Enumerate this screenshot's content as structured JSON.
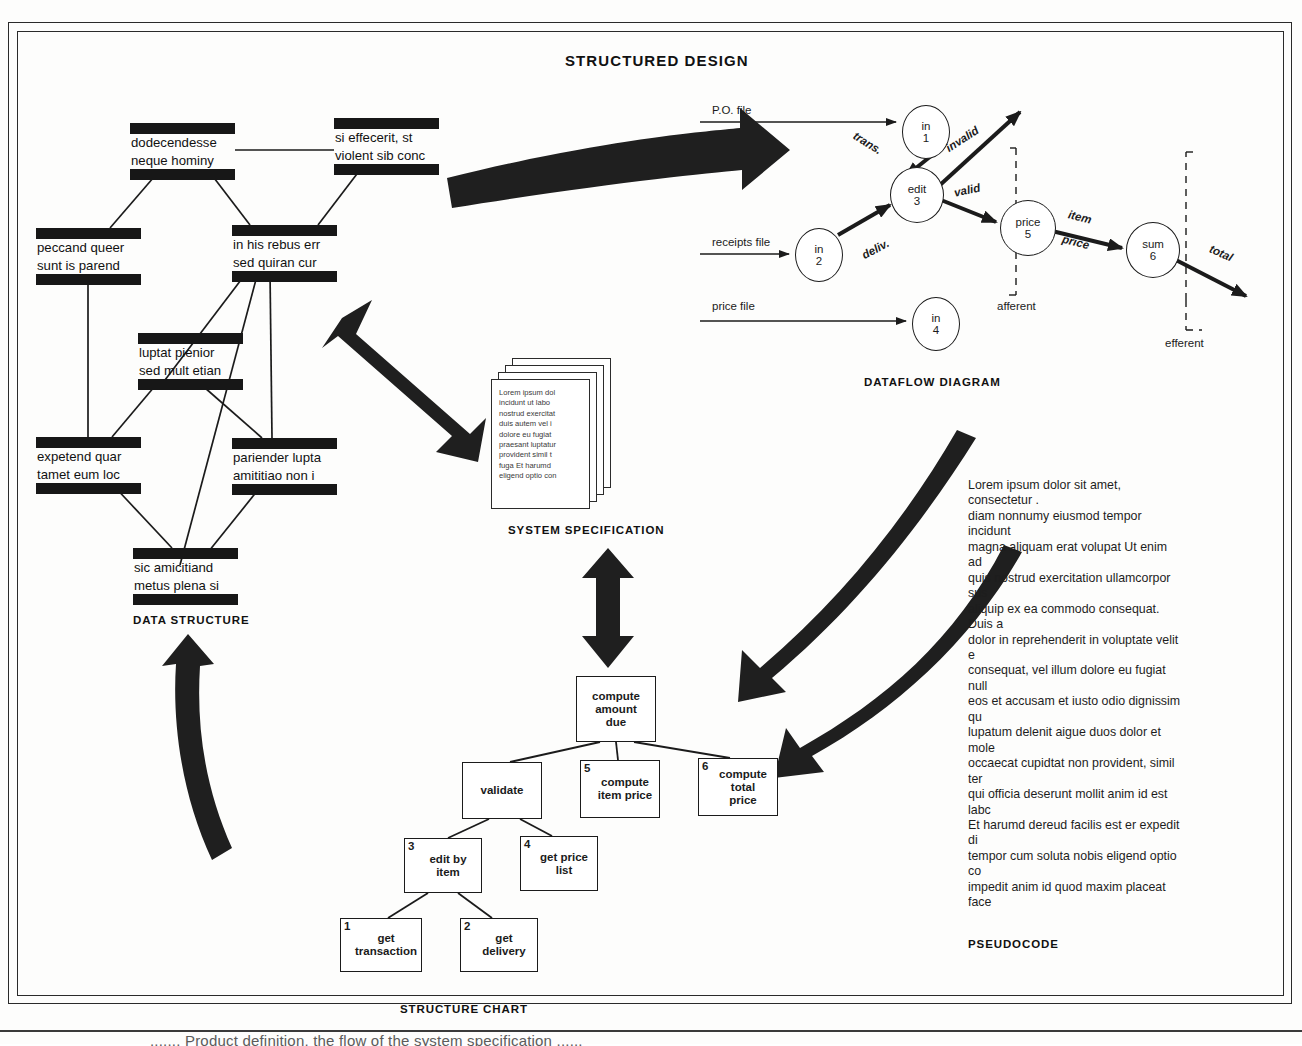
{
  "figure": {
    "title": "STRUCTURED DESIGN",
    "bottom_caption": "....... Product definition, the flow of the system specification ......"
  },
  "section_labels": {
    "data_structure": "DATA STRUCTURE",
    "dataflow_diagram": "DATAFLOW DIAGRAM",
    "system_specification": "SYSTEM SPECIFICATION",
    "structure_chart": "STRUCTURE CHART",
    "pseudocode": "PSEUDOCODE"
  },
  "data_structure": {
    "boxes": [
      {
        "id": "ds-dodecendesse",
        "line1": "dodecendesse",
        "line2": "neque hominy",
        "x": 130,
        "y": 123
      },
      {
        "id": "ds-si-effecerit",
        "line1": "si effecerit, st",
        "line2": "violent sib conc",
        "x": 334,
        "y": 118
      },
      {
        "id": "ds-peccand",
        "line1": "peccand queer",
        "line2": "sunt is parend",
        "x": 36,
        "y": 228
      },
      {
        "id": "ds-in-his-rebus",
        "line1": "in his rebus err",
        "line2": "sed quiran cur",
        "x": 232,
        "y": 225
      },
      {
        "id": "ds-luptat",
        "line1": "luptat pienior",
        "line2": "sed mult etian",
        "x": 138,
        "y": 333
      },
      {
        "id": "ds-expetend",
        "line1": "expetend quar",
        "line2": "tamet eum loc",
        "x": 36,
        "y": 437
      },
      {
        "id": "ds-pariender",
        "line1": "pariender lupta",
        "line2": "amititiao non i",
        "x": 232,
        "y": 438
      },
      {
        "id": "ds-sic-amicitiand",
        "line1": "sic amicitiand",
        "line2": "metus plena si",
        "x": 133,
        "y": 548
      }
    ]
  },
  "dataflow": {
    "inputs": [
      {
        "label": "P.O. file",
        "x": 712,
        "y": 104
      },
      {
        "label": "receipts file",
        "x": 712,
        "y": 236
      },
      {
        "label": "price file",
        "x": 712,
        "y": 300
      }
    ],
    "bubbles": [
      {
        "id": "bubble-in-1",
        "line1": "in",
        "line2": "1",
        "x": 902,
        "y": 105,
        "w": 46,
        "h": 52
      },
      {
        "id": "bubble-in-2",
        "line1": "in",
        "line2": "2",
        "x": 795,
        "y": 228,
        "w": 46,
        "h": 52
      },
      {
        "id": "bubble-in-4",
        "line1": "in",
        "line2": "4",
        "x": 912,
        "y": 297,
        "w": 46,
        "h": 52
      },
      {
        "id": "bubble-edit-3",
        "line1": "edit",
        "line2": "3",
        "x": 890,
        "y": 167,
        "w": 52,
        "h": 54
      },
      {
        "id": "bubble-price-5",
        "line1": "price",
        "line2": "5",
        "x": 1000,
        "y": 200,
        "w": 54,
        "h": 54
      },
      {
        "id": "bubble-sum-6",
        "line1": "sum",
        "line2": "6",
        "x": 1126,
        "y": 222,
        "w": 52,
        "h": 54
      }
    ],
    "flow_labels": [
      {
        "text": "trans.",
        "x": 852,
        "y": 137,
        "rot": 32
      },
      {
        "text": "deliv.",
        "x": 861,
        "y": 243,
        "rot": -28
      },
      {
        "text": "invalid",
        "x": 944,
        "y": 133,
        "rot": -33
      },
      {
        "text": "valid",
        "x": 954,
        "y": 184,
        "rot": -12
      },
      {
        "text": "item",
        "x": 1068,
        "y": 211,
        "rot": 14
      },
      {
        "text": "price",
        "x": 1062,
        "y": 236,
        "rot": 14
      },
      {
        "text": "total",
        "x": 1209,
        "y": 247,
        "rot": 24
      }
    ],
    "partition_labels": [
      {
        "text": "afferent",
        "x": 997,
        "y": 300
      },
      {
        "text": "efferent",
        "x": 1165,
        "y": 337
      }
    ]
  },
  "system_specification": {
    "page_text": "Lorem ipsum dol\nincidunt ut labo\nnostrud exercitat\nduis autem vel i\ndolore eu fugiat\npraesant luptatur\nprovident  simil t\nfuga  Et harumd\neligend optio con"
  },
  "structure_chart": {
    "boxes": [
      {
        "id": "sc-compute-amount-due",
        "num": "",
        "label": "compute\namount\ndue",
        "x": 576,
        "y": 676,
        "w": 80,
        "h": 66
      },
      {
        "id": "sc-validate",
        "num": "",
        "label": "validate",
        "x": 462,
        "y": 762,
        "w": 80,
        "h": 57
      },
      {
        "id": "sc-compute-item-price",
        "num": "5",
        "label": "compute\nitem price",
        "x": 580,
        "y": 760,
        "w": 80,
        "h": 58
      },
      {
        "id": "sc-compute-total-price",
        "num": "6",
        "label": "compute\ntotal\nprice",
        "x": 698,
        "y": 758,
        "w": 80,
        "h": 58
      },
      {
        "id": "sc-edit-by-item",
        "num": "3",
        "label": "edit by\nitem",
        "x": 404,
        "y": 838,
        "w": 78,
        "h": 55
      },
      {
        "id": "sc-get-price-list",
        "num": "4",
        "label": "get price\nlist",
        "x": 520,
        "y": 836,
        "w": 78,
        "h": 55
      },
      {
        "id": "sc-get-transaction",
        "num": "1",
        "label": "get\ntransaction",
        "x": 340,
        "y": 918,
        "w": 82,
        "h": 54
      },
      {
        "id": "sc-get-delivery",
        "num": "2",
        "label": "get\ndelivery",
        "x": 460,
        "y": 918,
        "w": 78,
        "h": 54
      }
    ]
  },
  "pseudocode": {
    "body": "Lorem ipsum dolor sit amet, consectetur .\ndiam nonnumy eiusmod tempor incidunt \nmagna aliquam erat volupat  Ut enim ad\nquis nostrud exercitation ullamcorpor sus\naliquip ex ea commodo consequat. Duis a\ndolor in reprehenderit in voluptate velit e\nconsequat, vel illum dolore eu fugiat null\neos et accusam et iusto odio dignissim qu\nlupatum delenit aigue duos dolor et mole\noccaecat cupidtat non provident, simil ter\nqui officia deserunt mollit anim id est labc\nEt harumd dereud facilis est er expedit di\ntempor cum soluta nobis eligend optio co\nimpedit anim id quod maxim placeat face\nvoluptas assumenda est, omnis dolor rep\nautem quinusd et aur office debit aut tu\natib saepe eveniet ut er repudiand sint et\nrecusand. Itaque earud rerum hic tenetury\nau aut prefer endis dolorib asperiore repel\ntene sentntiam, quid est cur verear ne ad\naccommodare nost ros quos tu paulo ant\ntum etia ergat. Nos amice et nebevol, oles\nfier ad augendas cum conscient to facto\nodioque civiuda. Et tamen in busdad ne\nest neque nonor imper ned libiding gen e\ncupiditat, quas nulla praid om umdant. In\npotius inflammad ut coercend magist anc\nvideantur. Invitat igitur vera ratio bene sı"
  },
  "colors": {
    "ink": "#171717",
    "paper": "#fdfdfc",
    "line": "#1b1b1b"
  }
}
